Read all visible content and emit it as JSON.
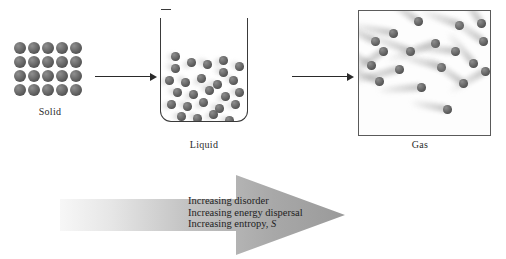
{
  "diagram": {
    "background_color": "#ffffff",
    "particle_color": "#5a5a5a",
    "outline_color": "#3a3a3a"
  },
  "phases": [
    {
      "id": "solid",
      "label": "Solid",
      "container": "none",
      "arrangement": "ordered lattice grid",
      "grid_columns": 5,
      "grid_rows": 4,
      "particle_count": 20,
      "motion": "vibration only, no trails"
    },
    {
      "id": "liquid",
      "label": "Liquid",
      "container": "beaker with rounded bottom corners, open top",
      "arrangement": "closely packed, random",
      "particle_count": 26,
      "motion": "short blurred motion trails"
    },
    {
      "id": "gas",
      "label": "Gas",
      "container": "square box outline",
      "arrangement": "widely dispersed, random",
      "particle_count": 19,
      "motion": "long blurred motion trails"
    }
  ],
  "transitions": [
    {
      "id": "solid-to-liquid",
      "from": "Solid",
      "to": "Liquid",
      "glyph": "→"
    },
    {
      "id": "liquid-to-gas",
      "from": "Liquid",
      "to": "Gas",
      "glyph": "→"
    }
  ],
  "entropy_arrow": {
    "direction": "left-to-right",
    "gradient_from": "#f4f4f4",
    "gradient_to": "#9d9d9d",
    "lines": [
      {
        "text": "Increasing disorder"
      },
      {
        "text": "Increasing energy dispersal"
      },
      {
        "text": "Increasing entropy, ",
        "symbol": "S",
        "symbol_style": "italic"
      }
    ]
  }
}
